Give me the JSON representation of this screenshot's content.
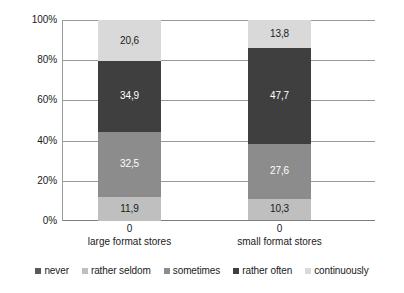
{
  "chart_data": {
    "type": "bar",
    "subtype": "stacked-100-percent",
    "title": "",
    "xlabel": "",
    "ylabel": "",
    "categories": [
      "large format stores",
      "small format stores"
    ],
    "category_sublabels": [
      "0",
      "0"
    ],
    "ylim": [
      0,
      100
    ],
    "ytick_labels": [
      "100%",
      "80%",
      "60%",
      "40%",
      "20%",
      "0%"
    ],
    "ytick_values": [
      100,
      80,
      60,
      40,
      20,
      0
    ],
    "grid": true,
    "legend_position": "bottom",
    "series": [
      {
        "name": "never",
        "values": [
          0,
          0
        ],
        "labels": [
          "",
          ""
        ],
        "color": "#595959",
        "text_color": "#ffffff"
      },
      {
        "name": "rather seldom",
        "values": [
          11.9,
          10.3
        ],
        "labels": [
          "11,9",
          "10,3"
        ],
        "color": "#bfbfbf",
        "text_color": "#1a1a1a"
      },
      {
        "name": "sometimes",
        "values": [
          32.5,
          27.6
        ],
        "labels": [
          "32,5",
          "27,6"
        ],
        "color": "#8c8c8c",
        "text_color": "#ffffff"
      },
      {
        "name": "rather often",
        "values": [
          34.9,
          47.7
        ],
        "labels": [
          "34,9",
          "47,7"
        ],
        "color": "#3f3f3f",
        "text_color": "#ffffff"
      },
      {
        "name": "continuously",
        "values": [
          20.6,
          13.8
        ],
        "labels": [
          "20,6",
          "13,8"
        ],
        "color": "#d9d9d9",
        "text_color": "#1a1a1a"
      }
    ]
  },
  "legend": {
    "items": [
      {
        "label": "never",
        "color": "#595959"
      },
      {
        "label": "rather seldom",
        "color": "#bfbfbf"
      },
      {
        "label": "sometimes",
        "color": "#8c8c8c"
      },
      {
        "label": "rather often",
        "color": "#3f3f3f"
      },
      {
        "label": "continuously",
        "color": "#d9d9d9"
      }
    ]
  },
  "axis": {
    "y_ticks": [
      {
        "label": "100%",
        "value": 100
      },
      {
        "label": "80%",
        "value": 80
      },
      {
        "label": "60%",
        "value": 60
      },
      {
        "label": "40%",
        "value": 40
      },
      {
        "label": "20%",
        "value": 20
      },
      {
        "label": "0%",
        "value": 0
      }
    ],
    "x_groups": [
      {
        "zero": "0",
        "name": "large format stores"
      },
      {
        "zero": "0",
        "name": "small format stores"
      }
    ]
  },
  "colors": {
    "grid": "#9a9a9a",
    "axis": "#7d7d7d",
    "background": "#ffffff",
    "text": "#1a1a1a"
  }
}
